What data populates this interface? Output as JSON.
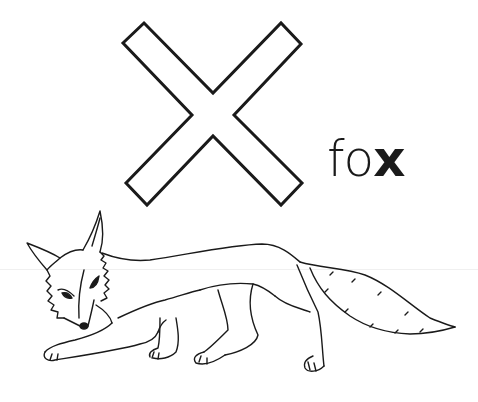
{
  "letter": {
    "glyph": "X",
    "style": "outline",
    "stroke_color": "#1a1a1a"
  },
  "word": {
    "prefix": "fo",
    "highlight": "x",
    "full": "fox"
  },
  "illustration": {
    "subject": "fox",
    "style": "line-drawing"
  },
  "colors": {
    "background": "#ffffff",
    "ink": "#1a1a1a"
  }
}
